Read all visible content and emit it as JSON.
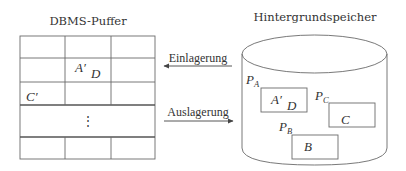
{
  "buffer": {
    "title": "DBMS-Puffer",
    "cells": {
      "a_prime": "A′",
      "d": "D",
      "c_prime": "C′",
      "ellipsis": "⋮"
    }
  },
  "arrows": {
    "in_label": "Einlagerung",
    "out_label": "Auslagerung"
  },
  "storage": {
    "title": "Hintergrundspeicher",
    "pages": [
      {
        "name": "P",
        "sub": "A",
        "content_1": "A′",
        "content_2": "D"
      },
      {
        "name": "P",
        "sub": "C",
        "content_1": "C"
      },
      {
        "name": "P",
        "sub": "B",
        "content_1": "B"
      }
    ]
  }
}
